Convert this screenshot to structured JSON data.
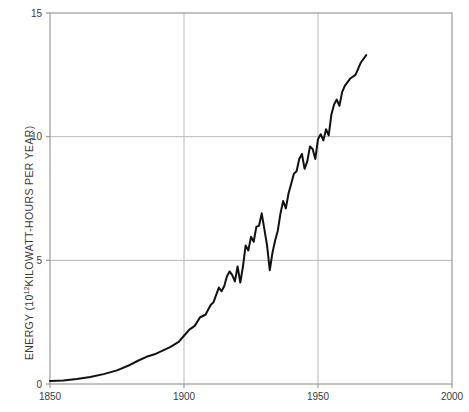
{
  "chart_data": {
    "type": "line",
    "title": "",
    "xlabel": "",
    "ylabel": "ENERGY (10¹² KILOWATT-HOURS PER YEAR)",
    "ylabel_base": "ENERGY (10",
    "ylabel_exp": "12",
    "ylabel_rest": " KILOWATT-HOURS PER YEAR)",
    "xlim": [
      1850,
      2000
    ],
    "ylim": [
      0,
      15
    ],
    "xticks": [
      1850,
      1900,
      1950,
      2000
    ],
    "xtick_labels": [
      "1850",
      "1900",
      "1950",
      "2000"
    ],
    "yticks": [
      0,
      5,
      10,
      15
    ],
    "ytick_labels": [
      "0",
      "5",
      "10",
      "15"
    ],
    "grid": true,
    "grid_color": "#b9b9b9",
    "frame_color": "#9a9a9a",
    "line_color": "#111111",
    "line_width": 2.0,
    "legend": null,
    "series": [
      {
        "name": "World energy consumption",
        "x": [
          1850,
          1855,
          1860,
          1865,
          1870,
          1875,
          1880,
          1883,
          1886,
          1889,
          1892,
          1895,
          1898,
          1900,
          1902,
          1904,
          1906,
          1908,
          1910,
          1911,
          1912,
          1913,
          1914,
          1915,
          1916,
          1917,
          1918,
          1919,
          1920,
          1921,
          1922,
          1923,
          1924,
          1925,
          1926,
          1927,
          1928,
          1929,
          1930,
          1931,
          1932,
          1933,
          1934,
          1935,
          1936,
          1937,
          1938,
          1939,
          1940,
          1941,
          1942,
          1943,
          1944,
          1945,
          1946,
          1947,
          1948,
          1949,
          1950,
          1951,
          1952,
          1953,
          1954,
          1955,
          1956,
          1957,
          1958,
          1959,
          1960,
          1962,
          1964,
          1966,
          1968
        ],
        "y": [
          0.12,
          0.14,
          0.2,
          0.28,
          0.4,
          0.55,
          0.78,
          0.95,
          1.1,
          1.2,
          1.35,
          1.5,
          1.7,
          1.95,
          2.2,
          2.35,
          2.7,
          2.8,
          3.2,
          3.3,
          3.6,
          3.9,
          3.75,
          3.95,
          4.35,
          4.55,
          4.4,
          4.15,
          4.75,
          4.1,
          4.75,
          5.6,
          5.4,
          5.95,
          5.75,
          6.35,
          6.4,
          6.9,
          6.25,
          5.6,
          4.6,
          5.3,
          5.8,
          6.2,
          6.9,
          7.4,
          7.1,
          7.7,
          8.1,
          8.5,
          8.6,
          9.1,
          9.3,
          8.7,
          9.0,
          9.6,
          9.5,
          9.1,
          9.9,
          10.1,
          9.85,
          10.3,
          10.05,
          10.9,
          11.3,
          11.5,
          11.25,
          11.8,
          12.05,
          12.35,
          12.5,
          13.0,
          13.3
        ]
      }
    ]
  },
  "plot_geometry": {
    "left": 50,
    "right": 452,
    "top": 13,
    "bottom": 384
  }
}
